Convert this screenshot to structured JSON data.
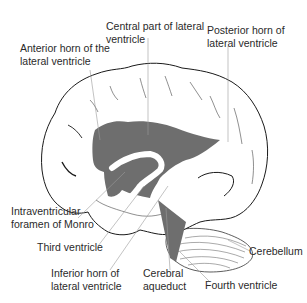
{
  "diagram": {
    "colors": {
      "ventricle_fill": "#6e6e6e",
      "outline": "#1a1a1a",
      "leader_line": "#9a9a9a",
      "label_text": "#2a2a2a"
    },
    "labels": {
      "central_part": {
        "line1": "Central part of lateral",
        "line2": "ventricle"
      },
      "anterior_horn": {
        "line1": "Anterior horn of the",
        "line2": "lateral ventricle"
      },
      "posterior_horn": {
        "line1": "Posterior horn of",
        "line2": "lateral ventricle"
      },
      "foramen_monro": {
        "line1": "Intraventricular",
        "line2": "foramen of Monro"
      },
      "third_ventricle": {
        "line1": "Third ventricle"
      },
      "inferior_horn": {
        "line1": "Inferior horn of",
        "line2": "lateral ventricle"
      },
      "cerebral_aqueduct": {
        "line1": "Cerebral",
        "line2": "aqueduct"
      },
      "fourth_ventricle": {
        "line1": "Fourth ventricle"
      },
      "cerebellum": {
        "line1": "Cerebellum"
      }
    }
  }
}
